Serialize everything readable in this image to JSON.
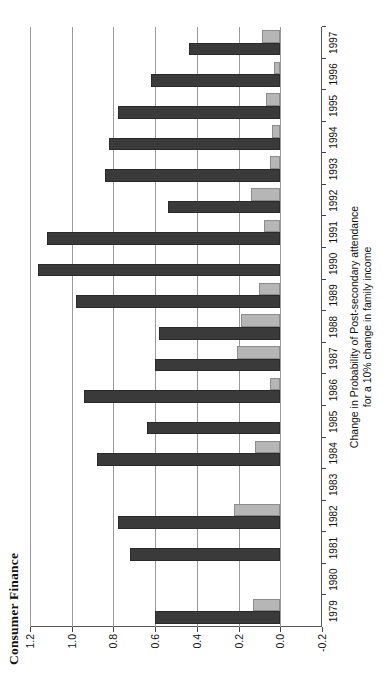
{
  "title": "Consumer Finance",
  "axis_caption_line1": "Change in Probability of Post-secondary attendance",
  "axis_caption_line2": "for a 10% change in family income",
  "colors": {
    "series_dark": "#3a3a3a",
    "series_light": "#b6b6b6",
    "grid": "#9a9a9a",
    "axis": "#444444",
    "background": "#ffffff"
  },
  "chart_data": {
    "type": "bar",
    "orientation": "horizontal",
    "title": "Consumer Finance",
    "xlabel": "",
    "ylabel": "Change in Probability of Post-secondary attendance for a 10% change in family income",
    "ylim": [
      -0.2,
      1.2
    ],
    "yticks": [
      1.2,
      1.0,
      0.8,
      0.6,
      0.4,
      0.2,
      0.0,
      -0.2
    ],
    "ytick_labels": [
      "1.2",
      "1.0",
      "0.8",
      "0.6",
      "0.4",
      "0.2",
      "0.0",
      "-0.2"
    ],
    "grid": true,
    "legend": false,
    "categories": [
      "1979",
      "1980",
      "1981",
      "1982",
      "1983",
      "1984",
      "1985",
      "1986",
      "1987",
      "1988",
      "1989",
      "1990",
      "1991",
      "1992",
      "1993",
      "1994",
      "1995",
      "1996",
      "1997"
    ],
    "series": [
      {
        "name": "dark",
        "values": [
          0.6,
          0.0,
          0.72,
          0.78,
          0.0,
          0.88,
          0.64,
          0.94,
          0.6,
          0.58,
          0.98,
          1.16,
          1.12,
          0.54,
          0.84,
          0.82,
          0.78,
          0.62,
          0.44
        ]
      },
      {
        "name": "light",
        "values": [
          0.13,
          0.0,
          0.0,
          0.22,
          0.0,
          0.12,
          0.0,
          0.05,
          0.21,
          0.19,
          0.1,
          0.0,
          0.08,
          0.14,
          0.05,
          0.04,
          0.07,
          0.03,
          0.09
        ]
      }
    ]
  }
}
